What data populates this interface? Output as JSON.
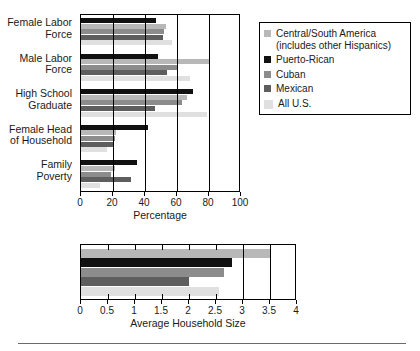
{
  "chart_data": [
    {
      "type": "bar",
      "orientation": "horizontal",
      "id": "percentage-chart",
      "title": "",
      "xlabel": "Percentage",
      "ylabel": "",
      "xlim": [
        0,
        100
      ],
      "xticks": [
        0,
        20,
        40,
        60,
        80,
        100
      ],
      "grid": true,
      "legend_position": "right",
      "categories": [
        "Female Labor\nForce",
        "Male Labor\nForce",
        "High School\nGraduate",
        "Female Head\nof Household",
        "Family\nPoverty"
      ],
      "series": [
        {
          "name": "Puerto-Rican",
          "color": "#111111",
          "values": [
            47,
            48,
            70,
            42,
            35
          ]
        },
        {
          "name": "Central/South America (includes other Hispanics)",
          "color": "#b8b8b8",
          "values": [
            53,
            80,
            66,
            22,
            21
          ]
        },
        {
          "name": "Cuban",
          "color": "#8c8c8c",
          "values": [
            52,
            60,
            63,
            21,
            19
          ]
        },
        {
          "name": "Mexican",
          "color": "#5e5e5e",
          "values": [
            51,
            54,
            46,
            20,
            31
          ]
        },
        {
          "name": "All U.S.",
          "color": "#e0e0e0",
          "values": [
            57,
            68,
            79,
            16,
            12
          ]
        }
      ]
    },
    {
      "type": "bar",
      "orientation": "horizontal",
      "id": "household-size-chart",
      "title": "",
      "xlabel": "Average Household Size",
      "ylabel": "",
      "xlim": [
        0,
        4
      ],
      "xticks": [
        0,
        0.5,
        1,
        1.5,
        2,
        2.5,
        3,
        3.5,
        4
      ],
      "grid": true,
      "categories": [
        ""
      ],
      "series": [
        {
          "name": "Central/South America (includes other Hispanics)",
          "color": "#b8b8b8",
          "values": [
            3.5
          ]
        },
        {
          "name": "Puerto-Rican",
          "color": "#111111",
          "values": [
            2.8
          ]
        },
        {
          "name": "Cuban",
          "color": "#8c8c8c",
          "values": [
            2.65
          ]
        },
        {
          "name": "Mexican",
          "color": "#5e5e5e",
          "values": [
            2.0
          ]
        },
        {
          "name": "All U.S.",
          "color": "#e0e0e0",
          "values": [
            2.55
          ]
        }
      ]
    }
  ],
  "top_chart": {
    "axis_title": "Percentage",
    "xticks": [
      "0",
      "20",
      "40",
      "60",
      "80",
      "100"
    ],
    "categories": [
      {
        "label": "Female Labor\nForce"
      },
      {
        "label": "Male Labor\nForce"
      },
      {
        "label": "High School\nGraduate"
      },
      {
        "label": "Female Head\nof Household"
      },
      {
        "label": "Family\nPoverty"
      }
    ]
  },
  "bottom_chart": {
    "axis_title": "Average Household Size",
    "xticks": [
      "0",
      "0.5",
      "1",
      "1.5",
      "2",
      "2.5",
      "3",
      "3.5",
      "4"
    ]
  },
  "legend": {
    "items": [
      {
        "label": "Central/South America\n(includes other Hispanics)",
        "color": "#b8b8b8",
        "name": "central-south-america"
      },
      {
        "label": "Puerto-Rican",
        "color": "#111111",
        "name": "puerto-rican"
      },
      {
        "label": "Cuban",
        "color": "#8c8c8c",
        "name": "cuban"
      },
      {
        "label": "Mexican",
        "color": "#5e5e5e",
        "name": "mexican"
      },
      {
        "label": "All U.S.",
        "color": "#e0e0e0",
        "name": "all-us"
      }
    ]
  },
  "colors": {
    "axis": "#000000",
    "text": "#1a1a1a",
    "background": "#ffffff",
    "rule": "#6b6b6b"
  }
}
